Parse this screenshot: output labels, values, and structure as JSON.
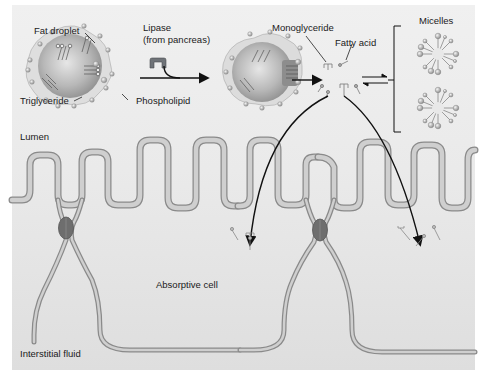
{
  "diagram": {
    "colors": {
      "background_panel": "#e6e6e6",
      "lumen_bg": "#ececec",
      "membrane_fill": "#c9c9c9",
      "membrane_stroke": "#8a8a8a",
      "droplet_core": "#b5b5b5",
      "droplet_coat": "#d8d8d8",
      "tight_junction": "#6e6e6e",
      "lipase": "#6f7378",
      "arrow": "#111111",
      "text": "#1a1a1a"
    },
    "labels": {
      "fat_droplet": "Fat droplet",
      "lipase_line1": "Lipase",
      "lipase_line2": "(from pancreas)",
      "triglyceride": "Triglyceride",
      "phospholipid": "Phospholipid",
      "monoglyceride": "Monoglyceride",
      "fatty_acid": "Fatty acid",
      "micelles": "Micelles",
      "lumen": "Lumen",
      "absorptive_cell": "Absorptive cell",
      "interstitial_fluid": "Interstitial fluid"
    },
    "nodes": [
      {
        "id": "fat-droplet",
        "label": "Fat droplet",
        "x": 65,
        "y": 65
      },
      {
        "id": "lipase",
        "label": "Lipase (from pancreas)",
        "x": 158,
        "y": 58
      },
      {
        "id": "digested-droplet",
        "label": "",
        "x": 275,
        "y": 67
      },
      {
        "id": "products",
        "label": "Monoglyceride / Fatty acid",
        "x": 340,
        "y": 80
      },
      {
        "id": "micelles",
        "label": "Micelles",
        "x": 440,
        "y": 75
      },
      {
        "id": "absorptive-cell-left",
        "label": "Absorptive cell",
        "x": 200,
        "y": 285
      },
      {
        "id": "absorptive-cell-right",
        "label": "",
        "x": 400,
        "y": 285
      }
    ],
    "edges": [
      {
        "from": "fat-droplet",
        "to": "digested-droplet",
        "label": "lipase action"
      },
      {
        "from": "digested-droplet",
        "to": "products",
        "label": ""
      },
      {
        "from": "products",
        "to": "micelles",
        "label": "reversible"
      },
      {
        "from": "products",
        "to": "absorptive-cell-left",
        "label": "diffusion"
      },
      {
        "from": "products",
        "to": "absorptive-cell-right",
        "label": "diffusion"
      }
    ]
  }
}
